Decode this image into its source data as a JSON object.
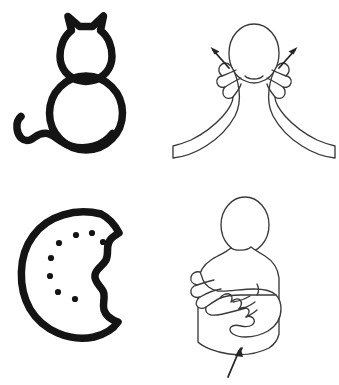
{
  "page": {
    "background_color": "#ffffff",
    "width": 339,
    "height": 385,
    "layout": "2x2 grid: left column line-art object icons, right column ASL sign demonstrations",
    "has_visible_text": false
  },
  "style": {
    "icon_stroke_color": "#141414",
    "icon_stroke_width": "7.5",
    "figure_stroke_color": "#3a3a3a",
    "figure_stroke_width": "1.35",
    "arrow_color": "#262626"
  },
  "cells": [
    {
      "id": "cat-icon",
      "name": "cat-icon-illustration",
      "row": 1,
      "column": 1,
      "subject": "cat",
      "kind": "object-icon",
      "description": "Thick black outline drawing of a cat seen from behind, sitting: pointed ears, round head, round body, curling tail crossing to the left",
      "caption": "",
      "parts": [
        "pointed-left-ear",
        "pointed-right-ear",
        "head-outline",
        "body-outline",
        "curled-tail"
      ]
    },
    {
      "id": "cat-sign",
      "name": "asl-sign-cat",
      "row": 1,
      "column": 2,
      "subject": "cat",
      "kind": "asl-sign",
      "description": "Line drawing of a head with two hands at the cheeks, thumb and index finger pinched, drawing outward like whiskers",
      "caption": "",
      "handshape": "F-hand / pinched thumb and index finger",
      "location": "both cheeks beside the mouth",
      "movement": "both hands move outward and slightly upward, tracing whiskers",
      "arrows": [
        {
          "name": "left-whisker-arrow",
          "direction": "up-left"
        },
        {
          "name": "right-whisker-arrow",
          "direction": "up-right"
        }
      ]
    },
    {
      "id": "cookie-icon",
      "name": "cookie-icon-illustration",
      "row": 2,
      "column": 1,
      "subject": "cookie",
      "kind": "object-icon",
      "description": "Thick black outline of a round chocolate-chip cookie with a scalloped bite taken out of the right side, eight small filled dots arranged in an arc",
      "caption": "",
      "chip_count": 8,
      "parts": [
        "cookie-outline",
        "bite-mark",
        "chocolate-chips"
      ]
    },
    {
      "id": "cookie-sign",
      "name": "asl-sign-cookie",
      "row": 2,
      "column": 2,
      "subject": "cookie",
      "kind": "asl-sign",
      "description": "Line drawing of a person's upper body; the left flat palm faces up while the right clawed hand presses and twists on it",
      "caption": "",
      "handshape": "claw hand over flat open palm",
      "location": "in front of the chest, dominant hand on non-dominant palm",
      "movement": "claw hand touches palm, twists, and touches again like a cookie cutter",
      "arrows": [
        {
          "name": "twist-motion-arrow",
          "direction": "up"
        }
      ]
    }
  ]
}
